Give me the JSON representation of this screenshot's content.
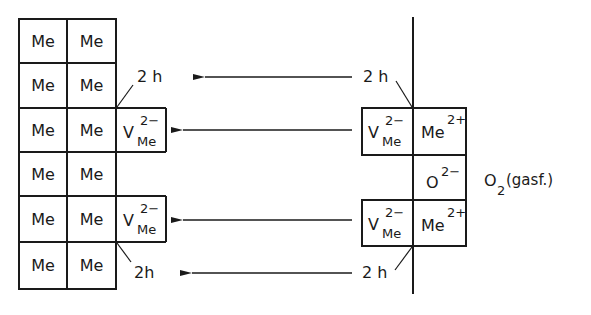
{
  "diagram": {
    "left_grid": {
      "rows": [
        [
          "Me",
          "Me"
        ],
        [
          "Me",
          "Me"
        ],
        [
          "Me",
          "Me"
        ],
        [
          "Me",
          "Me"
        ],
        [
          "Me",
          "Me"
        ],
        [
          "Me",
          "Me"
        ]
      ],
      "vacancy_label": {
        "base": "V",
        "sup": "2−",
        "sub": "Me"
      },
      "hole_label": "2 h"
    },
    "right_panel": {
      "vacancy_label": {
        "base": "V",
        "sup": "2−",
        "sub": "Me"
      },
      "cation_label": {
        "base": "Me",
        "sup": "2+"
      },
      "oxygen_ion": {
        "base": "O",
        "sup": "2−"
      },
      "gas_label": {
        "base": "O",
        "sub": "2",
        "suffix": "(gasf.)"
      },
      "hole_label": "2 h"
    },
    "arrows": [
      {
        "from": "2 h (right, top)",
        "to": "2 h (left, top)"
      },
      {
        "from": "V_Me (right, upper)",
        "to": "V_Me (left, upper)"
      },
      {
        "from": "V_Me (right, lower)",
        "to": "V_Me (left, lower)"
      },
      {
        "from": "2 h (right, bottom)",
        "to": "2h (left, bottom)"
      }
    ],
    "color": "#1a1a1a"
  }
}
